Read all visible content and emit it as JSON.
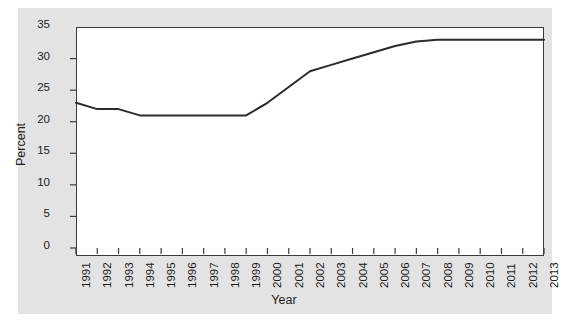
{
  "chart_data": {
    "type": "line",
    "title": "",
    "xlabel": "Year",
    "ylabel": "Percent",
    "categories": [
      "1991",
      "1992",
      "1993",
      "1994",
      "1995",
      "1996",
      "1997",
      "1998",
      "1999",
      "2000",
      "2001",
      "2002",
      "2003",
      "2004",
      "2005",
      "2006",
      "2007",
      "2008",
      "2009",
      "2010",
      "2011",
      "2012",
      "2013"
    ],
    "x": [
      1991,
      1992,
      1993,
      1994,
      1995,
      1996,
      1997,
      1998,
      1999,
      2000,
      2001,
      2002,
      2003,
      2004,
      2005,
      2006,
      2007,
      2008,
      2009,
      2010,
      2011,
      2012,
      2013
    ],
    "values": [
      23,
      22,
      22,
      21,
      21,
      21,
      21,
      21,
      21,
      23,
      25.5,
      28,
      29,
      30,
      31,
      32,
      32.7,
      33,
      33,
      33,
      33,
      33,
      33
    ],
    "series": [
      {
        "name": "Percent",
        "values": [
          23,
          22,
          22,
          21,
          21,
          21,
          21,
          21,
          21,
          23,
          25.5,
          28,
          29,
          30,
          31,
          32,
          32.7,
          33,
          33,
          33,
          33,
          33,
          33
        ],
        "color": "#2b2b2b"
      }
    ],
    "yticks": [
      0,
      5,
      10,
      15,
      20,
      25,
      30,
      35
    ],
    "ytick_labels": [
      "0",
      "5",
      "10",
      "15",
      "20",
      "25",
      "30",
      "35"
    ],
    "ylim": [
      0,
      35
    ],
    "xlim": [
      1991,
      2013
    ],
    "grid": false,
    "legend": false,
    "legend_position": "none",
    "line_width": 2,
    "panel_background": "#e3e3e3",
    "plot_background": "#ffffff",
    "axis_color": "#3a3a3a"
  },
  "caption": ""
}
